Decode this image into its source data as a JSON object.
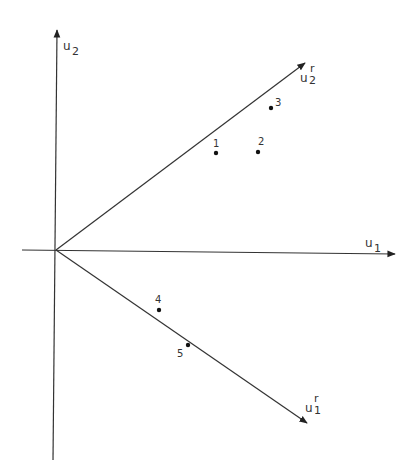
{
  "diagram": {
    "type": "coordinate-rotation",
    "colors": {
      "line": "#333333",
      "text": "#333333",
      "background": "#ffffff"
    },
    "origin": {
      "x": 56,
      "y": 250
    },
    "axes": [
      {
        "id": "u1",
        "label": "u",
        "subscript": "1",
        "superscript": "",
        "x1": 22,
        "y1": 250,
        "x2": 395,
        "y2": 254
      },
      {
        "id": "u2",
        "label": "u",
        "subscript": "2",
        "superscript": "",
        "x1": 53,
        "y1": 460,
        "x2": 57,
        "y2": 30
      },
      {
        "id": "u1r",
        "label": "u",
        "subscript": "1",
        "superscript": "r",
        "x1": 56,
        "y1": 250,
        "x2": 307,
        "y2": 423
      },
      {
        "id": "u2r",
        "label": "u",
        "subscript": "2",
        "superscript": "r",
        "x1": 56,
        "y1": 250,
        "x2": 305,
        "y2": 63
      }
    ],
    "points": [
      {
        "label": "1",
        "x": 216,
        "y": 153
      },
      {
        "label": "2",
        "x": 258,
        "y": 152
      },
      {
        "label": "3",
        "x": 271,
        "y": 108
      },
      {
        "label": "4",
        "x": 159,
        "y": 310
      },
      {
        "label": "5",
        "x": 188,
        "y": 345
      }
    ]
  }
}
